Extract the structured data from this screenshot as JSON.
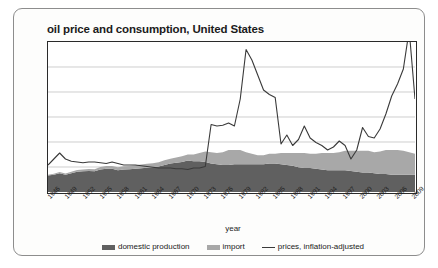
{
  "figure": {
    "title": "oil price and consumption, United States"
  },
  "legend": {
    "items": [
      {
        "label": "domestic production",
        "marker": "area-swatch",
        "color": "#606060"
      },
      {
        "label": "import",
        "marker": "area-swatch",
        "color": "#a8a8a8"
      },
      {
        "label": "prices, inflation-adjusted",
        "marker": "line",
        "color": "#3a3a3a"
      }
    ]
  },
  "chart_data": {
    "type": "area",
    "title": "oil price and consumption, United States",
    "xlabel": "year",
    "ylabel": "",
    "grid": true,
    "gridlines": 5,
    "legend_position": "bottom",
    "stacked": true,
    "xlim": [
      1946,
      2009
    ],
    "ylim": [
      0,
      100
    ],
    "tick_labels": [
      "1946",
      "1949",
      "1952",
      "1955",
      "1958",
      "1961",
      "1964",
      "1967",
      "1970",
      "1973",
      "1976",
      "1979",
      "1982",
      "1985",
      "1988",
      "1991",
      "1994",
      "1997",
      "2000",
      "2003",
      "2006",
      "2009"
    ],
    "x": [
      1946,
      1947,
      1948,
      1949,
      1950,
      1951,
      1952,
      1953,
      1954,
      1955,
      1956,
      1957,
      1958,
      1959,
      1960,
      1961,
      1962,
      1963,
      1964,
      1965,
      1966,
      1967,
      1968,
      1969,
      1970,
      1971,
      1972,
      1973,
      1974,
      1975,
      1976,
      1977,
      1978,
      1979,
      1980,
      1981,
      1982,
      1983,
      1984,
      1985,
      1986,
      1987,
      1988,
      1989,
      1990,
      1991,
      1992,
      1993,
      1994,
      1995,
      1996,
      1997,
      1998,
      1999,
      2000,
      2001,
      2002,
      2003,
      2004,
      2005,
      2006,
      2007,
      2008,
      2009
    ],
    "series": [
      {
        "name": "domestic production",
        "color": "#606060",
        "values": [
          11.0,
          11.5,
          12.5,
          11.5,
          12.5,
          13.5,
          13.8,
          14.0,
          13.8,
          15.0,
          15.5,
          15.5,
          14.5,
          15.0,
          15.2,
          15.5,
          15.8,
          16.2,
          16.5,
          17.0,
          18.0,
          19.0,
          19.5,
          20.0,
          21.0,
          20.5,
          20.5,
          20.0,
          19.0,
          18.5,
          18.0,
          18.0,
          18.5,
          18.5,
          18.5,
          18.5,
          18.5,
          18.5,
          19.0,
          19.0,
          18.5,
          18.0,
          17.5,
          16.5,
          16.0,
          16.0,
          15.5,
          15.0,
          14.5,
          14.5,
          14.5,
          14.5,
          14.0,
          13.5,
          13.0,
          13.0,
          12.5,
          12.0,
          12.0,
          11.5,
          11.5,
          11.5,
          11.5,
          11.5
        ]
      },
      {
        "name": "import",
        "color": "#a8a8a8",
        "values": [
          0.5,
          0.7,
          0.8,
          0.8,
          1.0,
          1.1,
          1.2,
          1.3,
          1.4,
          1.6,
          1.8,
          1.8,
          2.0,
          2.1,
          2.2,
          2.3,
          2.5,
          2.6,
          2.7,
          2.9,
          3.1,
          3.2,
          3.5,
          3.8,
          4.0,
          4.5,
          5.5,
          7.0,
          7.5,
          7.5,
          8.5,
          10.0,
          9.5,
          9.5,
          8.0,
          7.0,
          6.0,
          6.0,
          6.5,
          6.5,
          7.5,
          8.0,
          8.5,
          9.5,
          10.0,
          9.5,
          10.0,
          11.0,
          11.5,
          11.5,
          12.0,
          13.0,
          13.5,
          14.0,
          14.5,
          14.5,
          14.0,
          15.0,
          16.0,
          16.5,
          16.5,
          16.0,
          15.0,
          14.0
        ]
      }
    ],
    "line_series": {
      "name": "prices, inflation-adjusted",
      "color": "#3a3a3a",
      "values": [
        18.0,
        22.0,
        26.0,
        22.0,
        20.5,
        20.0,
        19.5,
        20.0,
        20.0,
        19.5,
        19.0,
        20.0,
        19.0,
        18.0,
        18.0,
        18.0,
        17.5,
        17.0,
        16.5,
        16.0,
        16.0,
        16.0,
        15.5,
        15.5,
        15.0,
        16.0,
        16.0,
        17.0,
        45.0,
        44.0,
        44.5,
        46.0,
        44.0,
        62.0,
        95.0,
        88.0,
        78.0,
        68.0,
        65.0,
        63.0,
        32.0,
        38.0,
        31.0,
        35.0,
        44.0,
        36.0,
        33.0,
        31.0,
        28.0,
        30.0,
        34.0,
        31.0,
        22.0,
        28.0,
        43.0,
        37.0,
        36.0,
        42.0,
        52.0,
        64.0,
        72.0,
        82.0,
        108.0,
        62.0
      ]
    }
  }
}
